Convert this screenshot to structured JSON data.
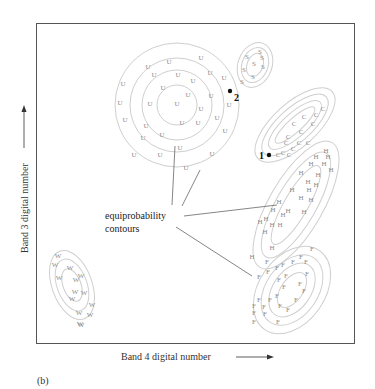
{
  "figure": {
    "panel_label": "(b)",
    "x_axis_label": "Band 4 digital number",
    "y_axis_label": "Band 3 digital number",
    "annotation": [
      "equiprobability",
      "contours"
    ],
    "markers": [
      {
        "id": "1",
        "label": "1"
      },
      {
        "id": "2",
        "label": "2"
      }
    ],
    "colors": {
      "contour": "#cfcfcf",
      "point": "#8a8a8a",
      "frame": "#555555",
      "text": "#222222"
    }
  },
  "chart_data": {
    "type": "scatter",
    "title": "",
    "xlabel": "Band 4 digital number",
    "ylabel": "Band 3 digital number",
    "grid": false,
    "axis_ticks": "none",
    "classes": [
      {
        "name": "U",
        "contour_levels": 4
      },
      {
        "name": "S",
        "contour_levels": 3
      },
      {
        "name": "C",
        "contour_levels": 4
      },
      {
        "name": "H",
        "contour_levels": 3
      },
      {
        "name": "F",
        "contour_levels": 4
      },
      {
        "name": "W",
        "contour_levels": 3
      }
    ],
    "unknown_pixels": [
      {
        "label": "1",
        "near_class": "C"
      },
      {
        "label": "2",
        "near_class": "U"
      }
    ],
    "annotation": "equiprobability contours"
  }
}
